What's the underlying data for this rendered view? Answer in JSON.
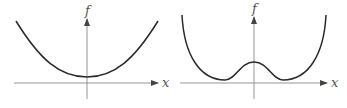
{
  "panels": [
    {
      "name": "left",
      "y_axis_label": "f",
      "x_axis_label": "x",
      "description": "Single-well convex curve with minimum at x=0 slightly above the x-axis"
    },
    {
      "name": "right",
      "y_axis_label": "f",
      "x_axis_label": "x",
      "description": "Double-well curve with local maximum at x=0 and two symmetric minima"
    }
  ],
  "colors": {
    "curve": "#2a2a2a",
    "axis": "#8a8a8a",
    "label": "#555555",
    "background": "#ffffff"
  }
}
